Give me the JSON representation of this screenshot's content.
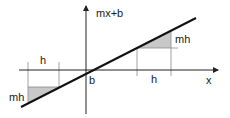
{
  "diagram": {
    "labels": {
      "function": "mx+b",
      "intercept": "b",
      "x_axis": "x",
      "run_left": "h",
      "rise_left": "mh",
      "run_right": "h",
      "rise_right": "mh"
    },
    "colors": {
      "axis": "#222222",
      "line": "#111111",
      "guide": "#8a8a8a",
      "shade": "#c8c8c8",
      "background": "#ffffff"
    }
  }
}
